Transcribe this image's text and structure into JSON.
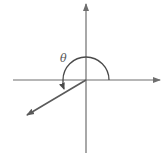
{
  "diagram": {
    "type": "angle-in-standard-position",
    "angle_label": "θ",
    "colors": {
      "axis": "#6e6e6e",
      "ray": "#5a5a5a",
      "arc": "#4a4a4a",
      "label": "#555555",
      "background": "#ffffff"
    },
    "elements": {
      "x_axis": "horizontal axis with arrow pointing right",
      "y_axis": "vertical axis with arrow pointing up",
      "terminal_ray": "ray in third quadrant with arrowhead",
      "arc": "counterclockwise arc from positive x-axis to terminal ray"
    }
  }
}
